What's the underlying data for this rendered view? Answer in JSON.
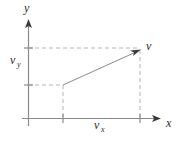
{
  "figure": {
    "background_color": "#ffffff",
    "axis_color": "#8a8a8a",
    "dash_color": "#b4b4b4",
    "vector_color": "#8a8a8a",
    "text_color": "#2b2b2b"
  },
  "axes": {
    "x_axis": {
      "label": "x",
      "label_x": 167,
      "label_y": 128,
      "y": 118.5,
      "x_start": 22,
      "x_end": 161
    },
    "y_axis": {
      "label": "y",
      "label_x": 24,
      "label_y": 14,
      "x": 28.5,
      "y_start": 126,
      "y_end": 19
    }
  },
  "labels": {
    "vy": {
      "text": "v",
      "sub": "y",
      "x": 10,
      "y": 66
    },
    "vx": {
      "text": "v",
      "sub": "x",
      "x": 95,
      "y": 131
    },
    "v": {
      "text": "v",
      "x": 146,
      "y": 51
    }
  },
  "vector": {
    "name": "v",
    "tail_x": 63,
    "tail_y": 85,
    "head_x": 140,
    "head_y": 50
  },
  "guides": {
    "horizontal_top": {
      "x1": 28,
      "y1": 48,
      "x2": 140,
      "y2": 48
    },
    "horizontal_mid": {
      "x1": 28,
      "y1": 85,
      "x2": 63,
      "y2": 85
    },
    "vertical_left": {
      "x1": 63,
      "y1": 85,
      "x2": 63,
      "y2": 118
    },
    "vertical_right": {
      "x1": 140,
      "y1": 50,
      "x2": 140,
      "y2": 118
    }
  },
  "ticks": {
    "y_top": {
      "x1": 24,
      "y1": 48,
      "x2": 33,
      "y2": 48
    },
    "y_mid": {
      "x1": 24,
      "y1": 85,
      "x2": 33,
      "y2": 85
    },
    "x_left": {
      "x1": 63,
      "y1": 114,
      "x2": 63,
      "y2": 123
    },
    "x_right": {
      "x1": 140,
      "y1": 114,
      "x2": 140,
      "y2": 123
    }
  }
}
